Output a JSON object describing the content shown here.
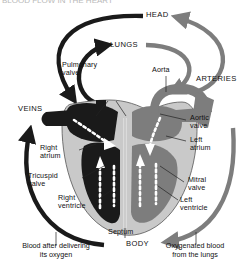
{
  "figure": {
    "title_cropped": "BLOOD FLOW IN THE HEART",
    "caption_left": "Blood after delivering\nits oxygen",
    "caption_right": "Oxygenated blood\nfrom the lungs"
  },
  "destinations": {
    "head": "HEAD",
    "lungs": "LUNGS",
    "body": "BODY",
    "veins": "VEINS",
    "arteries": "ARTERIES"
  },
  "structures": {
    "aorta": "Aorta",
    "pulmonary_valve": "Pulmonary\nvalve",
    "aortic_valve": "Aortic\nvalve",
    "right_atrium": "Right\natrium",
    "left_atrium": "Left\natrium",
    "tricuspid_valve": "Tricuspid\nvalve",
    "mitral_valve": "Mitral\nvalve",
    "right_ventricle": "Right\nventricle",
    "left_ventricle": "Left\nventricle",
    "septum": "Septum"
  },
  "colors": {
    "deoxygenated": "#1a1a1a",
    "oxygenated": "#7d7d7d",
    "muscle_wall": "#c9c9c9",
    "flow_arrow": "#ffffff",
    "background": "#ffffff",
    "leader_line": "#222222"
  },
  "flow": {
    "deoxygenated_path": "BODY → VEINS → Right atrium → Tricuspid valve → Right ventricle → Pulmonary valve → LUNGS",
    "oxygenated_path": "LUNGS → Left atrium → Mitral valve → Left ventricle → Aortic valve → Aorta → ARTERIES → HEAD / BODY"
  }
}
